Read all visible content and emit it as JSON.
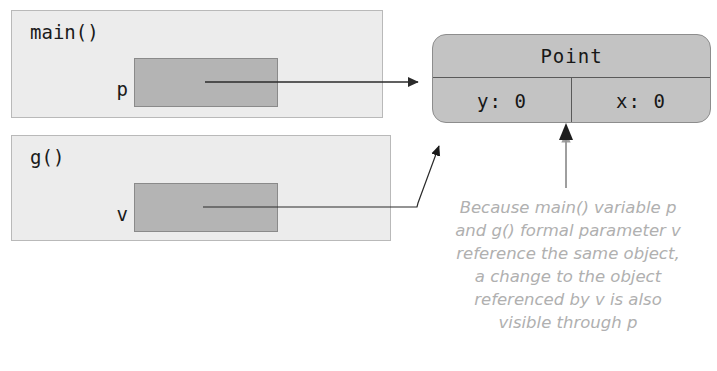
{
  "diagram": {
    "frames": [
      {
        "id": "main",
        "label": "main()",
        "variable": {
          "name": "p",
          "slot_fill": "#b4b4b4"
        }
      },
      {
        "id": "g",
        "label": "g()",
        "variable": {
          "name": "v",
          "slot_fill": "#b4b4b4"
        }
      }
    ],
    "object": {
      "type_label": "Point",
      "fields": [
        {
          "name": "y",
          "value": "0",
          "text": "y: 0"
        },
        {
          "name": "x",
          "value": "0",
          "text": "x: 0"
        }
      ]
    },
    "caption": "Because main() variable p\nand g() formal parameter v\nreference the same object,\na change to the object\nreferenced by v is also\nvisible through p",
    "colors": {
      "frame_fill": "#ececec",
      "frame_stroke": "#b9b9b9",
      "slot_fill": "#b4b4b4",
      "slot_stroke": "#8a8a8a",
      "object_fill": "#c3c3c3",
      "object_stroke": "#8d8d8d",
      "divider": "#5a5a5a",
      "arrow": "#2b2b2b",
      "caption_text": "#b0b0b0",
      "background": "#ffffff"
    },
    "arrows": [
      {
        "id": "p-to-point",
        "from": "p-slot",
        "to": "point-object-left",
        "style": "horizontal"
      },
      {
        "id": "v-to-point",
        "from": "v-slot",
        "to": "point-object-bottom-left",
        "style": "elbow-diagonal"
      },
      {
        "id": "caption-to-point",
        "from": "caption",
        "to": "point-object-field-divider",
        "style": "vertical"
      }
    ]
  }
}
